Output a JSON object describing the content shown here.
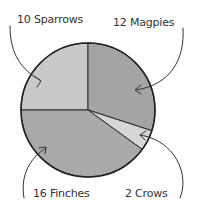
{
  "chart_data": {
    "type": "pie",
    "title": "",
    "categories": [
      "Sparrows",
      "Magpies",
      "Crows",
      "Finches"
    ],
    "values": [
      10,
      12,
      2,
      16
    ],
    "labels": [
      "10 Sparrows",
      "12 Magpies",
      "2 Crows",
      "16 Finches"
    ],
    "colors": [
      "#c9c9c9",
      "#a4a4a4",
      "#d6d6d6",
      "#a9a9a9"
    ],
    "start_angle_deg": 0,
    "direction": "clockwise",
    "legend": "none",
    "annotations": "labels with curved arrows pointing to slices"
  },
  "labels": {
    "sparrows": "10 Sparrows",
    "magpies": "12 Magpies",
    "crows": "2 Crows",
    "finches": "16 Finches"
  }
}
